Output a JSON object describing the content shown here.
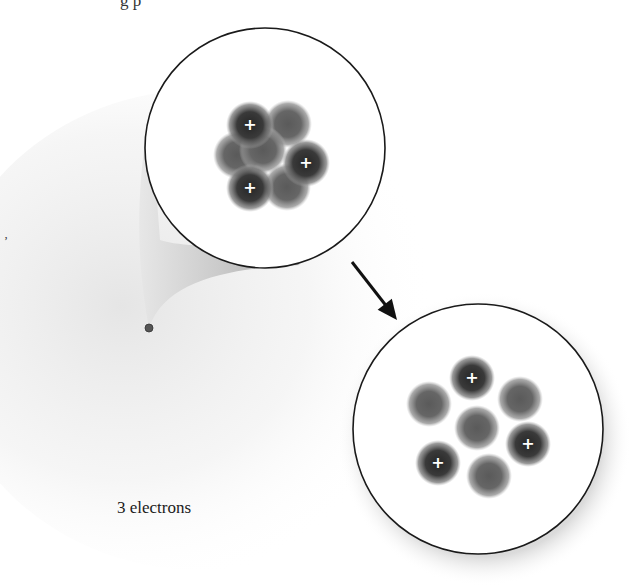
{
  "figure": {
    "caption_top_fragment": "g   p",
    "stray_mark": "ʼ",
    "atom_label": "3 electrons",
    "colors": {
      "background": "#ffffff",
      "haze": "#d9d9d9",
      "circle_stroke": "#1a1a1a",
      "particle_dark": "#2e2e2e",
      "particle_mid": "#6a6a6a",
      "plus_sign": "#ffffff",
      "arrow": "#111111"
    },
    "atom_point": {
      "x": 149,
      "y": 328
    },
    "zoom_circle_top": {
      "cx": 265,
      "cy": 148,
      "r": 120,
      "label": "nucleus (packed)",
      "particles": [
        {
          "x": 250,
          "y": 125,
          "charge": "+"
        },
        {
          "x": 288,
          "y": 124,
          "charge": ""
        },
        {
          "x": 237,
          "y": 155,
          "charge": ""
        },
        {
          "x": 306,
          "y": 163,
          "charge": "+"
        },
        {
          "x": 263,
          "y": 150,
          "charge": ""
        },
        {
          "x": 250,
          "y": 188,
          "charge": "+"
        },
        {
          "x": 287,
          "y": 187,
          "charge": ""
        }
      ]
    },
    "zoom_circle_bottom": {
      "cx": 478,
      "cy": 429,
      "r": 125,
      "label": "nucleus (separated)",
      "particles": [
        {
          "x": 472,
          "y": 378,
          "charge": "+"
        },
        {
          "x": 429,
          "y": 404,
          "charge": ""
        },
        {
          "x": 520,
          "y": 399,
          "charge": ""
        },
        {
          "x": 477,
          "y": 428,
          "charge": ""
        },
        {
          "x": 528,
          "y": 444,
          "charge": "+"
        },
        {
          "x": 438,
          "y": 463,
          "charge": "+"
        },
        {
          "x": 489,
          "y": 476,
          "charge": ""
        }
      ]
    },
    "arrow": {
      "x1": 352,
      "y1": 262,
      "x2": 397,
      "y2": 320
    },
    "counts": {
      "protons": 3,
      "neutrons": 4,
      "electrons": 3
    }
  }
}
